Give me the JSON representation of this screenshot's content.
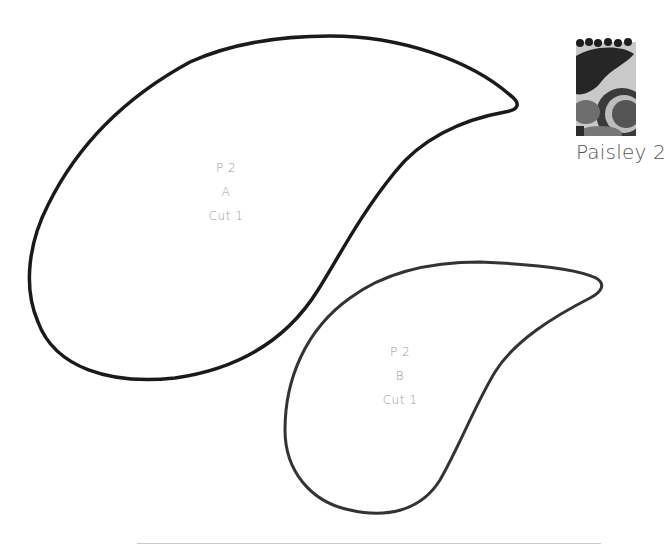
{
  "pattern": {
    "title": "Paisley 2",
    "thumbnail": {
      "description": "grayscale fabric swatch with paisley and circle motifs",
      "colors": [
        "#1e1e1e",
        "#3a3a3a",
        "#6e6e6e",
        "#a8a8a8",
        "#d8d8d8"
      ]
    }
  },
  "pieces": [
    {
      "id": "A",
      "label_line1": "P 2",
      "label_line2": "A",
      "label_line3": "Cut 1",
      "outline_color": "#1a1a1a"
    },
    {
      "id": "B",
      "label_line1": "P 2",
      "label_line2": "B",
      "label_line3": "Cut 1",
      "outline_color": "#333333"
    }
  ],
  "colors": {
    "background": "#ffffff",
    "label_text": "#9a9a9a",
    "title_text": "#555555",
    "rule": "#c8c8c8"
  }
}
